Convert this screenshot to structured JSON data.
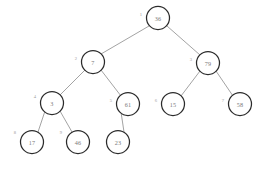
{
  "figure": {
    "kind": "binary-tree-diagram",
    "background_color": "#ffffff",
    "node_fill_color": "#ffffff",
    "node_stroke_color": "#2b2b2b",
    "edge_color": "#8c8c8c",
    "value_text_color": "#7a7a7a",
    "index_text_color": "#9a9a9a",
    "width": 273,
    "height": 176
  },
  "chart_data": {
    "type": "diagram",
    "title": "",
    "nodes": [
      {
        "id": "n1",
        "index_label": "1",
        "value": "36",
        "cx": 158,
        "cy": 18,
        "r": 11.5,
        "index_x": 141,
        "index_y": 14
      },
      {
        "id": "n2",
        "index_label": "2",
        "value": "7",
        "cx": 93,
        "cy": 62,
        "r": 11.5,
        "index_x": 76,
        "index_y": 58
      },
      {
        "id": "n3",
        "index_label": "3",
        "value": "79",
        "cx": 208,
        "cy": 63,
        "r": 11.5,
        "index_x": 191,
        "index_y": 59
      },
      {
        "id": "n4",
        "index_label": "4",
        "value": "3",
        "cx": 52,
        "cy": 103,
        "r": 11.5,
        "index_x": 35,
        "index_y": 96
      },
      {
        "id": "n5",
        "index_label": "5",
        "value": "61",
        "cx": 128,
        "cy": 104,
        "r": 11.5,
        "index_x": 111,
        "index_y": 100
      },
      {
        "id": "n6",
        "index_label": "6",
        "value": "15",
        "cx": 173,
        "cy": 104,
        "r": 11.5,
        "index_x": 156,
        "index_y": 100
      },
      {
        "id": "n7",
        "index_label": "7",
        "value": "58",
        "cx": 240,
        "cy": 104,
        "r": 11.5,
        "index_x": 223,
        "index_y": 100
      },
      {
        "id": "n8",
        "index_label": "8",
        "value": "17",
        "cx": 32,
        "cy": 142,
        "r": 11.5,
        "index_x": 15,
        "index_y": 132
      },
      {
        "id": "n9",
        "index_label": "9",
        "value": "46",
        "cx": 78,
        "cy": 142,
        "r": 11.5,
        "index_x": 61,
        "index_y": 132
      },
      {
        "id": "n10",
        "index_label": "",
        "value": "23",
        "cx": 118,
        "cy": 142,
        "r": 11.5,
        "index_x": 101,
        "index_y": 132
      }
    ],
    "edges": [
      {
        "from": "n1",
        "to": "n2",
        "x1": 149,
        "y1": 26,
        "x2": 101,
        "y2": 54
      },
      {
        "from": "n1",
        "to": "n3",
        "x1": 167,
        "y1": 26,
        "x2": 200,
        "y2": 55
      },
      {
        "from": "n2",
        "to": "n4",
        "x1": 85,
        "y1": 70,
        "x2": 60,
        "y2": 95
      },
      {
        "from": "n2",
        "to": "n5",
        "x1": 101,
        "y1": 70,
        "x2": 121,
        "y2": 96
      },
      {
        "from": "n3",
        "to": "n6",
        "x1": 200,
        "y1": 71,
        "x2": 181,
        "y2": 96
      },
      {
        "from": "n3",
        "to": "n7",
        "x1": 216,
        "y1": 71,
        "x2": 233,
        "y2": 96
      },
      {
        "from": "n4",
        "to": "n8",
        "x1": 45,
        "y1": 111,
        "x2": 38,
        "y2": 132
      },
      {
        "from": "n4",
        "to": "n9",
        "x1": 60,
        "y1": 111,
        "x2": 72,
        "y2": 132
      },
      {
        "from": "n5",
        "to": "n10",
        "x1": 121,
        "y1": 112,
        "x2": 124,
        "y2": 132
      }
    ]
  }
}
